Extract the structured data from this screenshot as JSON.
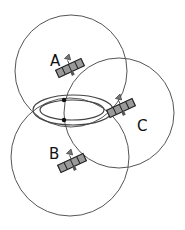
{
  "diagram": {
    "colors": {
      "circle_stroke": "#555555",
      "ellipse_stroke": "#444444",
      "panel_fill": "#9a9a9a",
      "panel_stroke": "#222222",
      "dot": "#111111",
      "label": "#111111"
    },
    "satellites": [
      {
        "label": "A",
        "cx": 70,
        "cy": 68,
        "circle_r": 56,
        "circle_cx": 71,
        "circle_cy": 71,
        "label_x": 50,
        "label_y": 66
      },
      {
        "label": "B",
        "cx": 72,
        "cy": 163,
        "circle_r": 59,
        "circle_cx": 70,
        "circle_cy": 157,
        "label_x": 49,
        "label_y": 159
      },
      {
        "label": "C",
        "cx": 121,
        "cy": 108,
        "circle_r": 55,
        "circle_cx": 119,
        "circle_cy": 113,
        "label_x": 137,
        "label_y": 131
      }
    ],
    "ellipses": {
      "outer": {
        "cx": 73,
        "cy": 110,
        "rx": 40,
        "ry": 15
      },
      "inner": {
        "cx": 72,
        "cy": 110,
        "rx": 32,
        "ry": 10
      }
    },
    "intersection_points": [
      {
        "x": 64,
        "y": 100
      },
      {
        "x": 64,
        "y": 120
      }
    ]
  }
}
